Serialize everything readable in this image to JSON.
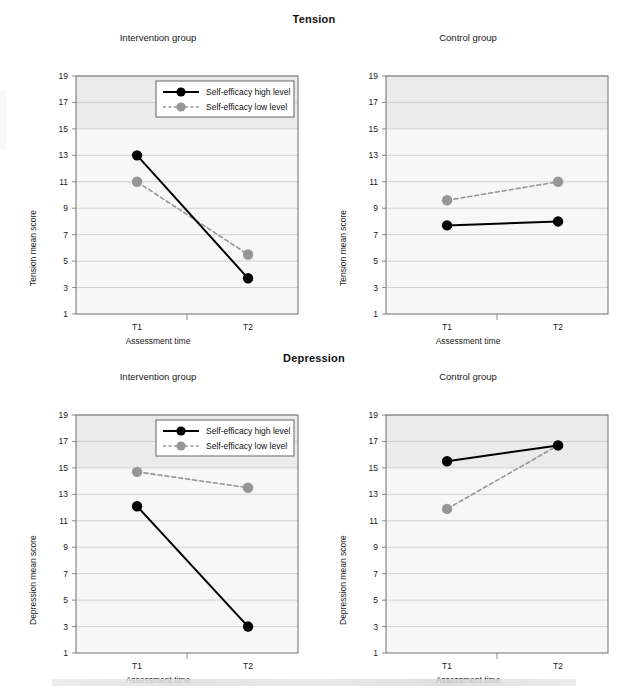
{
  "figure": {
    "section_titles": [
      "Tension",
      "Depression"
    ],
    "panel_titles": [
      "Intervention group",
      "Control group"
    ],
    "legend": {
      "high": "Self-efficacy high level",
      "low": "Self-efficacy low level"
    },
    "axis": {
      "x_label": "Assessment time",
      "y_label_tension": "Tension mean score",
      "y_label_depression": "Depression mean score",
      "x_ticks": [
        "T1",
        "T2"
      ],
      "y_ticks": [
        "19",
        "17",
        "15",
        "13",
        "11",
        "9",
        "7",
        "5",
        "3",
        "1"
      ]
    },
    "colors": {
      "high_series": "#000000",
      "low_series": "#969696",
      "panel_bg": "#f7f7f7",
      "panel_bg_upper": "#ebebeb",
      "gridline": "#c8c8c8",
      "axis": "#6e6e6e"
    }
  },
  "chart_data": [
    {
      "type": "line",
      "title": "Tension — Intervention group",
      "xlabel": "Assessment time",
      "ylabel": "Tension mean score",
      "categories": [
        "T1",
        "T2"
      ],
      "ylim": [
        1,
        19
      ],
      "yticks": [
        1,
        3,
        5,
        7,
        9,
        11,
        13,
        15,
        17,
        19
      ],
      "grid": true,
      "legend_position": "top-right",
      "series": [
        {
          "name": "Self-efficacy high level",
          "values": [
            13.0,
            3.7
          ],
          "color": "#000000",
          "style": "solid"
        },
        {
          "name": "Self-efficacy low level",
          "values": [
            11.0,
            5.5
          ],
          "color": "#969696",
          "style": "dashed"
        }
      ]
    },
    {
      "type": "line",
      "title": "Tension — Control group",
      "xlabel": "Assessment time",
      "ylabel": "Tension mean score",
      "categories": [
        "T1",
        "T2"
      ],
      "ylim": [
        1,
        19
      ],
      "yticks": [
        1,
        3,
        5,
        7,
        9,
        11,
        13,
        15,
        17,
        19
      ],
      "grid": true,
      "legend_position": "none",
      "series": [
        {
          "name": "Self-efficacy high level",
          "values": [
            7.7,
            8.0
          ],
          "color": "#000000",
          "style": "solid"
        },
        {
          "name": "Self-efficacy low level",
          "values": [
            9.6,
            11.0
          ],
          "color": "#969696",
          "style": "dashed"
        }
      ]
    },
    {
      "type": "line",
      "title": "Depression — Intervention group",
      "xlabel": "Assessment time",
      "ylabel": "Depression mean score",
      "categories": [
        "T1",
        "T2"
      ],
      "ylim": [
        1,
        19
      ],
      "yticks": [
        1,
        3,
        5,
        7,
        9,
        11,
        13,
        15,
        17,
        19
      ],
      "grid": true,
      "legend_position": "top-right",
      "series": [
        {
          "name": "Self-efficacy high level",
          "values": [
            12.1,
            3.0
          ],
          "color": "#000000",
          "style": "solid"
        },
        {
          "name": "Self-efficacy low level",
          "values": [
            14.7,
            13.5
          ],
          "color": "#969696",
          "style": "dashed"
        }
      ]
    },
    {
      "type": "line",
      "title": "Depression — Control group",
      "xlabel": "Assessment time",
      "ylabel": "Depression mean score",
      "categories": [
        "T1",
        "T2"
      ],
      "ylim": [
        1,
        19
      ],
      "yticks": [
        1,
        3,
        5,
        7,
        9,
        11,
        13,
        15,
        17,
        19
      ],
      "grid": true,
      "legend_position": "none",
      "series": [
        {
          "name": "Self-efficacy high level",
          "values": [
            15.5,
            16.7
          ],
          "color": "#000000",
          "style": "solid"
        },
        {
          "name": "Self-efficacy low level",
          "values": [
            11.9,
            16.7
          ],
          "color": "#969696",
          "style": "dashed"
        }
      ]
    }
  ]
}
